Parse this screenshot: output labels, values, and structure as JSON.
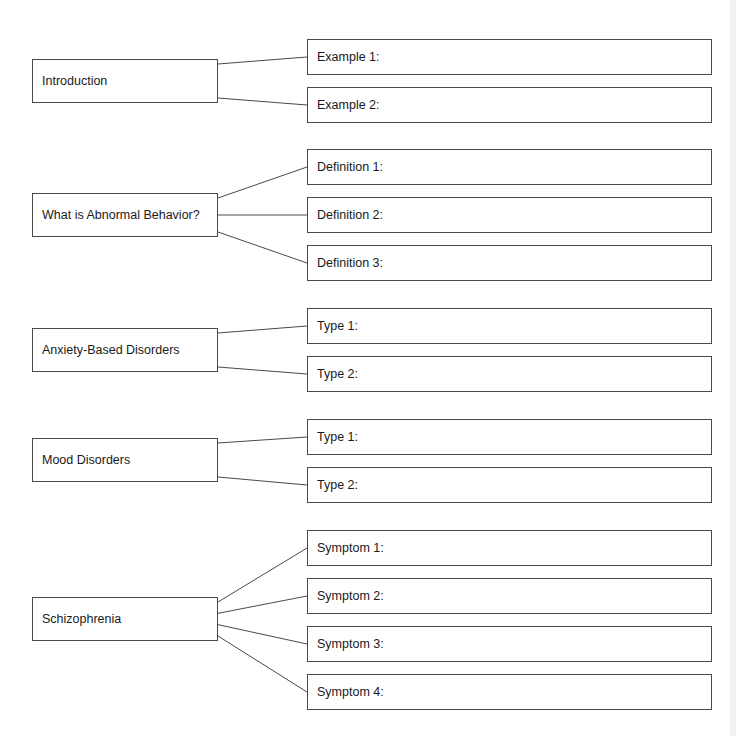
{
  "groups": [
    {
      "topic": "Introduction",
      "topic_top": 59,
      "slots": [
        {
          "label": "Example 1:",
          "top": 39
        },
        {
          "label": "Example 2:",
          "top": 87
        }
      ]
    },
    {
      "topic": "What is Abnormal Behavior?",
      "topic_top": 193,
      "slots": [
        {
          "label": "Definition 1:",
          "top": 149
        },
        {
          "label": "Definition 2:",
          "top": 197
        },
        {
          "label": "Definition 3:",
          "top": 245
        }
      ]
    },
    {
      "topic": "Anxiety-Based Disorders",
      "topic_top": 328,
      "slots": [
        {
          "label": "Type 1:",
          "top": 308
        },
        {
          "label": "Type 2:",
          "top": 356
        }
      ]
    },
    {
      "topic": "Mood Disorders",
      "topic_top": 438,
      "slots": [
        {
          "label": "Type 1:",
          "top": 419
        },
        {
          "label": "Type 2:",
          "top": 467
        }
      ]
    },
    {
      "topic": "Schizophrenia",
      "topic_top": 597,
      "slots": [
        {
          "label": "Symptom 1:",
          "top": 530
        },
        {
          "label": "Symptom 2:",
          "top": 578
        },
        {
          "label": "Symptom 3:",
          "top": 626
        },
        {
          "label": "Symptom 4:",
          "top": 674
        }
      ]
    }
  ]
}
